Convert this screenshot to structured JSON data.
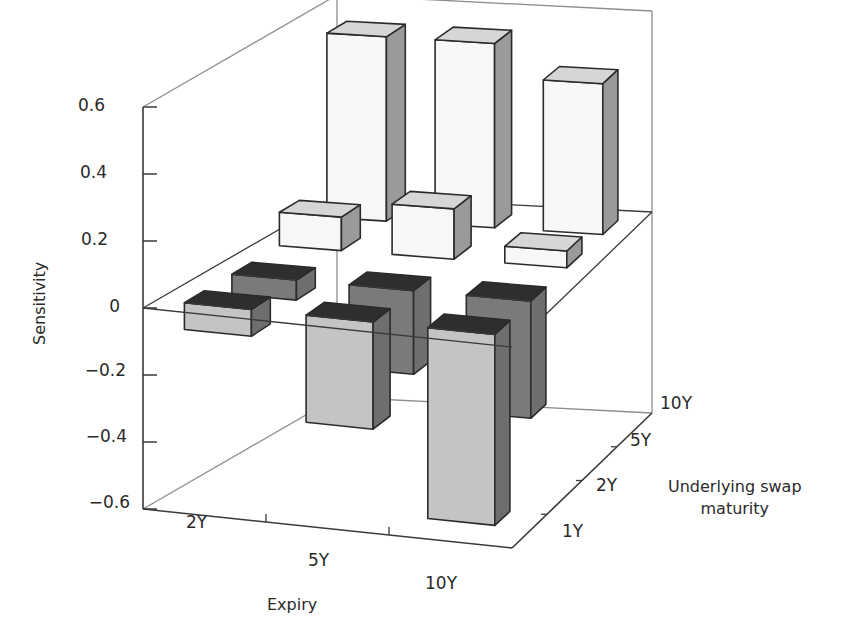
{
  "chart_data": {
    "type": "bar3d",
    "title": "",
    "zlabel": "Sensitivity",
    "xlabel": "Expiry",
    "ylabel": "Underlying swap maturity",
    "ylabel_lines": [
      "Underlying swap",
      "maturity"
    ],
    "x_categories": [
      "2Y",
      "5Y",
      "10Y"
    ],
    "y_categories": [
      "1Y",
      "2Y",
      "5Y",
      "10Y"
    ],
    "z_ticks": [
      "0.6",
      "0.4",
      "0.2",
      "0",
      "−0.2",
      "−0.4",
      "−0.6"
    ],
    "zlim": [
      -0.6,
      0.6
    ],
    "series": [
      {
        "name": "1Y",
        "values": [
          -0.08,
          -0.32,
          -0.57
        ]
      },
      {
        "name": "2Y",
        "values": [
          -0.06,
          -0.25,
          -0.35
        ]
      },
      {
        "name": "5Y",
        "values": [
          0.1,
          0.15,
          0.05
        ]
      },
      {
        "name": "10Y",
        "values": [
          0.55,
          0.55,
          0.45
        ]
      }
    ],
    "colors": {
      "negative_front": "#c4c4c4",
      "negative_side": "#6e6e6e",
      "negative_top": "#2e2e2e",
      "negative_back_front": "#7a7a7a",
      "positive_front": "#f7f7f7",
      "positive_side": "#9a9a9a",
      "positive_top": "#d6d6d6",
      "frame": "#8c8c8c",
      "axis": "#3a3a3a"
    },
    "grid": false,
    "legend": "none"
  }
}
